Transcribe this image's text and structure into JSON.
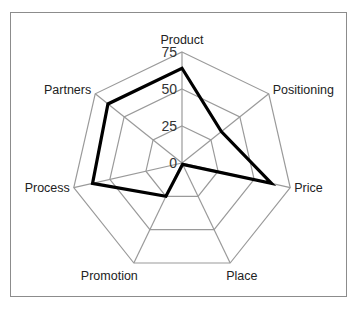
{
  "chart_data": {
    "type": "radar",
    "title": "",
    "categories": [
      "Product",
      "Positioning",
      "Price",
      "Place",
      "Promotion",
      "Process",
      "Partners"
    ],
    "series": [
      {
        "name": "Score",
        "values": [
          64,
          34,
          62,
          1,
          25,
          62,
          64
        ],
        "color": "#000000"
      }
    ],
    "rlim": [
      0,
      75
    ],
    "ticks": [
      "0",
      "25",
      "50",
      "75"
    ],
    "tick_values": [
      0,
      25,
      50,
      75
    ],
    "grid": true,
    "legend": "none",
    "grid_color": "#9a9a9a"
  }
}
